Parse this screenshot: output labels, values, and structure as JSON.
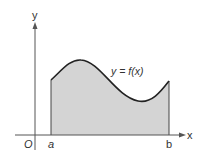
{
  "diagram": {
    "axes": {
      "x_label": "x",
      "y_label": "y",
      "origin_label": "O"
    },
    "curve_label": "y = f(x)",
    "bounds": {
      "lower": "a",
      "upper": "b"
    },
    "colors": {
      "fill": "#d4d4d4",
      "curve": "#222222",
      "axis": "#555555"
    }
  }
}
